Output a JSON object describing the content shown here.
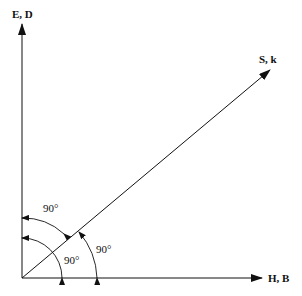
{
  "diagram": {
    "type": "vector-orientation",
    "vectors": [
      {
        "id": "e_d",
        "label": "E, D",
        "direction": "vertical-up"
      },
      {
        "id": "h_b",
        "label": "H, B",
        "direction": "horizontal-right"
      },
      {
        "id": "s_k",
        "label": "S, k",
        "direction": "diagonal-up-right"
      }
    ],
    "angles": [
      {
        "id": "angle_e_s",
        "label": "90°",
        "between": [
          "E, D",
          "S, k"
        ]
      },
      {
        "id": "angle_e_h",
        "label": "90°",
        "between": [
          "E, D",
          "H, B"
        ]
      },
      {
        "id": "angle_s_h",
        "label": "90°",
        "between": [
          "S, k",
          "H, B"
        ]
      }
    ],
    "colors": {
      "stroke": "#111111",
      "background": "#ffffff"
    }
  }
}
